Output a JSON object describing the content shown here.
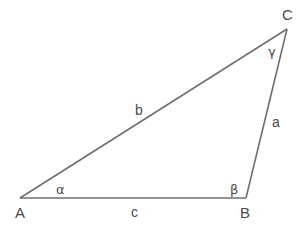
{
  "diagram": {
    "type": "triangle",
    "stroke_color": "#6f6f6f",
    "label_color": "#4a4a4a",
    "vertices": [
      {
        "id": "A",
        "label": "A",
        "x": 20,
        "y": 198
      },
      {
        "id": "B",
        "label": "B",
        "x": 246,
        "y": 198
      },
      {
        "id": "C",
        "label": "C",
        "x": 287,
        "y": 29
      }
    ],
    "sides": [
      {
        "id": "a",
        "label": "a",
        "from": "B",
        "to": "C"
      },
      {
        "id": "b",
        "label": "b",
        "from": "A",
        "to": "C"
      },
      {
        "id": "c",
        "label": "c",
        "from": "A",
        "to": "B"
      }
    ],
    "angles": [
      {
        "id": "alpha",
        "label": "α",
        "at": "A"
      },
      {
        "id": "beta",
        "label": "β",
        "at": "B"
      },
      {
        "id": "gamma",
        "label": "γ",
        "at": "C"
      }
    ]
  }
}
